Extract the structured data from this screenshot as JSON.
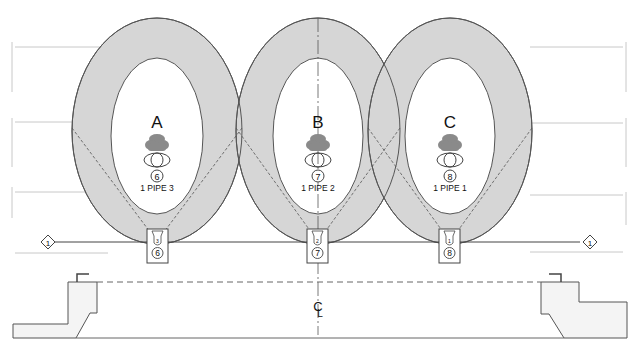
{
  "diagram": {
    "colors": {
      "ring_fill": "#d6d6d6",
      "stroke": "#555555",
      "guide": "#c8c8c8",
      "figure": "#8a8a8a",
      "base_fill": "#f4f4f4"
    },
    "zones": [
      {
        "letter": "A",
        "number": "6",
        "pipe_label": "1 PIPE 3",
        "small_num": "3",
        "cx": 157
      },
      {
        "letter": "B",
        "number": "7",
        "pipe_label": "1 PIPE 2",
        "small_num": "2",
        "cx": 318
      },
      {
        "letter": "C",
        "number": "8",
        "pipe_label": "1 PIPE 1",
        "small_num": "1",
        "cx": 450
      }
    ],
    "markers": {
      "left": "1",
      "right": "1"
    },
    "centerline_symbol": "C",
    "centerline_sub": "L"
  }
}
